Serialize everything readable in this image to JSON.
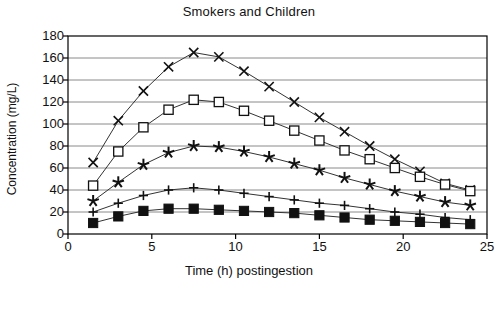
{
  "chart_data": {
    "type": "line",
    "title": "Smokers and Children",
    "xlabel": "Time (h) postingestion",
    "ylabel": "Concentration (mg/L)",
    "xlim": [
      0,
      25
    ],
    "ylim": [
      0,
      180
    ],
    "xticks": [
      0,
      5,
      10,
      15,
      20,
      25
    ],
    "yticks": [
      0,
      20,
      40,
      60,
      80,
      100,
      120,
      140,
      160,
      180
    ],
    "grid": "horizontal",
    "legend": "none",
    "x": [
      1.5,
      3.0,
      4.5,
      6.0,
      7.5,
      9.0,
      10.5,
      12.0,
      13.5,
      15.0,
      16.5,
      18.0,
      19.5,
      21.0,
      22.5,
      24.0
    ],
    "series": [
      {
        "name": "series-cross",
        "marker": "x",
        "values": [
          65,
          103,
          130,
          152,
          165,
          161,
          148,
          134,
          120,
          106,
          93,
          80,
          68,
          57,
          46,
          40
        ]
      },
      {
        "name": "series-open-square",
        "marker": "open-square",
        "values": [
          44,
          75,
          97,
          113,
          122,
          120,
          112,
          103,
          94,
          85,
          76,
          68,
          60,
          52,
          45,
          39
        ]
      },
      {
        "name": "series-star",
        "marker": "star",
        "values": [
          30,
          47,
          63,
          74,
          80,
          79,
          75,
          70,
          64,
          58,
          51,
          45,
          39,
          34,
          29,
          26
        ]
      },
      {
        "name": "series-plus",
        "marker": "plus",
        "values": [
          20,
          28,
          35,
          40,
          42,
          40,
          37,
          34,
          31,
          28,
          26,
          23,
          20,
          18,
          15,
          13
        ]
      },
      {
        "name": "series-filled-square",
        "marker": "filled-square",
        "values": [
          10,
          16,
          21,
          23,
          23,
          22,
          21,
          20,
          19,
          17,
          15,
          13,
          12,
          11,
          10,
          9
        ]
      }
    ]
  },
  "colors": {
    "line": "#333333",
    "grid": "#8a8a8a",
    "axis": "#000000",
    "text": "#111111"
  }
}
